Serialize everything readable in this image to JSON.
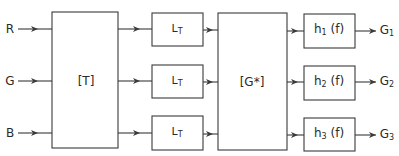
{
  "diagram": {
    "inputs": [
      {
        "label": "R",
        "y": 29
      },
      {
        "label": "G",
        "y": 81
      },
      {
        "label": "B",
        "y": 133
      }
    ],
    "transform_block": {
      "label": "[T]"
    },
    "lt_blocks": [
      {
        "label_main": "L",
        "label_sub": "T"
      },
      {
        "label_main": "L",
        "label_sub": "T"
      },
      {
        "label_main": "L",
        "label_sub": "T"
      }
    ],
    "gstar_block": {
      "label": "[G*]"
    },
    "filter_blocks": [
      {
        "label_main": "h",
        "label_sub": "1",
        "label_arg": "(f)"
      },
      {
        "label_main": "h",
        "label_sub": "2",
        "label_arg": "(f)"
      },
      {
        "label_main": "h",
        "label_sub": "3",
        "label_arg": "(f)"
      }
    ],
    "outputs": [
      {
        "label_main": "G",
        "label_sub": "1"
      },
      {
        "label_main": "G",
        "label_sub": "2"
      },
      {
        "label_main": "G",
        "label_sub": "3"
      }
    ]
  }
}
